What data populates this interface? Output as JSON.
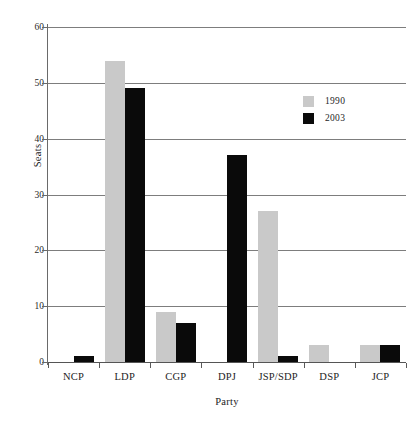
{
  "chart_data": {
    "type": "bar",
    "title": "",
    "xlabel": "Party",
    "ylabel": "Seats",
    "categories": [
      "NCP",
      "LDP",
      "CGP",
      "DPJ",
      "JSP/SDP",
      "DSP",
      "JCP"
    ],
    "series": [
      {
        "name": "1990",
        "color": "#c9c9c9",
        "values": [
          null,
          54,
          9,
          null,
          27,
          3,
          3
        ]
      },
      {
        "name": "2003",
        "color": "#0a0a0a",
        "values": [
          1,
          49,
          7,
          37,
          1,
          null,
          3
        ]
      }
    ],
    "ylim": [
      0,
      60
    ],
    "yticks": [
      0,
      10,
      20,
      30,
      40,
      50,
      60
    ],
    "ytick_labels": [
      "0",
      "10",
      "20",
      "30",
      "40",
      "50",
      "60"
    ],
    "grid": "horizontal",
    "legend_position": "upper-right"
  },
  "legend": {
    "entries": [
      {
        "label": "1990"
      },
      {
        "label": "2003"
      }
    ]
  },
  "axes": {
    "y_title": "Seats",
    "x_title": "Party"
  }
}
